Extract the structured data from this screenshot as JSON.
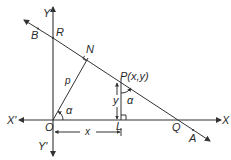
{
  "diagram": {
    "type": "coordinate-geometry",
    "labels": {
      "x_axis_pos": "X",
      "x_axis_neg": "X'",
      "y_axis_pos": "Y",
      "y_axis_neg": "Y'",
      "origin": "O",
      "point_R": "R",
      "point_B": "B",
      "point_N": "N",
      "point_P": "P(x,y)",
      "point_L": "L",
      "point_Q": "Q",
      "point_A": "A",
      "perpendicular": "p",
      "angle_at_O": "α",
      "angle_at_P": "α",
      "dim_y": "y",
      "dim_x": "x"
    },
    "colors": {
      "line": "#333333",
      "text": "#2a2a2a",
      "background": "#ffffff"
    }
  }
}
